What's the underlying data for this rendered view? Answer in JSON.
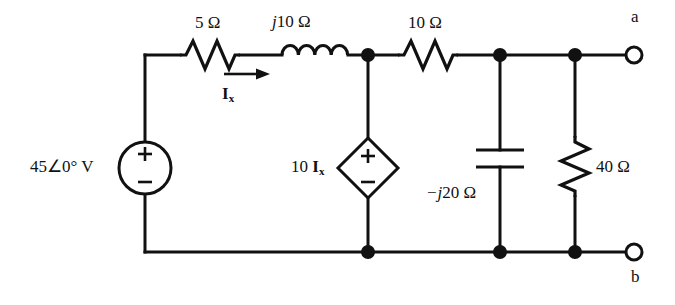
{
  "diagram": {
    "type": "electrical-schematic",
    "stroke_color": "#111111",
    "background_color": "#ffffff"
  },
  "components": {
    "resistor_5": {
      "label": "5 Ω",
      "kind": "resistor",
      "value": "5",
      "unit": "Ω"
    },
    "inductor_j10": {
      "label_prefix": "j",
      "label_rest": "10 Ω",
      "kind": "inductor",
      "value": "j10",
      "unit": "Ω"
    },
    "resistor_10": {
      "label": "10 Ω",
      "kind": "resistor",
      "value": "10",
      "unit": "Ω"
    },
    "capacitor_j20": {
      "label_prefix": "−j",
      "label_rest": "20 Ω",
      "kind": "capacitor",
      "value": "-j20",
      "unit": "Ω"
    },
    "resistor_40": {
      "label": "40 Ω",
      "kind": "resistor",
      "value": "40",
      "unit": "Ω"
    },
    "voltage_source": {
      "label": "45∠0° V",
      "kind": "independent-voltage-source",
      "magnitude": "45",
      "phase": "0°",
      "unit": "V",
      "plus": "+",
      "minus": "−"
    },
    "dependent_source": {
      "label_gain": "10 ",
      "label_var": "I",
      "label_sub": "x",
      "kind": "dependent-voltage-source",
      "plus": "+",
      "minus": "−"
    }
  },
  "current": {
    "name": "I",
    "subscript": "x",
    "direction": "right"
  },
  "terminals": {
    "a": "a",
    "b": "b"
  }
}
